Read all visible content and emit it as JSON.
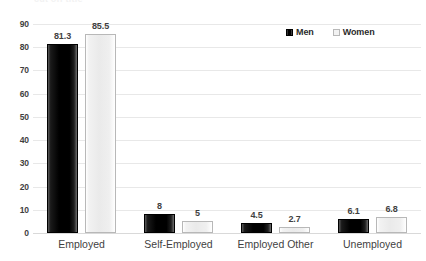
{
  "chart_data": {
    "type": "bar",
    "title": "",
    "xlabel": "",
    "ylabel": "",
    "ylim": [
      0,
      90
    ],
    "ytick_step": 10,
    "yticks": [
      90,
      80,
      70,
      60,
      50,
      40,
      30,
      20,
      10,
      0
    ],
    "grid": true,
    "legend_position": "top-right",
    "categories": [
      "Employed",
      "Self-Employed",
      "Employed Other",
      "Unemployed"
    ],
    "series": [
      {
        "name": "Men",
        "color": "#000000",
        "values": [
          81.3,
          8,
          4.5,
          6.1
        ],
        "labels": [
          "81.3",
          "8",
          "4.5",
          "6.1"
        ]
      },
      {
        "name": "Women",
        "color": "#eeeeee",
        "values": [
          85.5,
          5,
          2.7,
          6.8
        ],
        "labels": [
          "85.5",
          "5",
          "2.7",
          "6.8"
        ]
      }
    ]
  },
  "legend": {
    "items": [
      {
        "label": "Men",
        "marker": "square-dark-icon"
      },
      {
        "label": "Women",
        "marker": "square-light-icon"
      }
    ]
  },
  "title_remnant": "cut off title"
}
